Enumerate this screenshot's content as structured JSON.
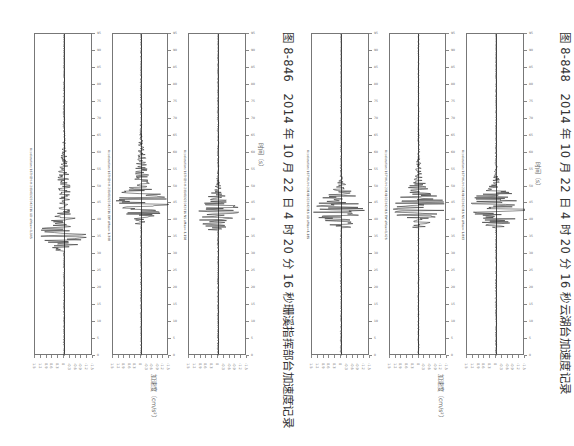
{
  "page": {
    "orientation": "rotated-90-clockwise"
  },
  "figures": [
    {
      "caption": "图 8-846　2014 年 10 月 22 日 4 时 20 分 16 秒珊溪指挥部台加速度记录",
      "time_axis_label": "时间（s）",
      "accel_axis_label": "加速度（cm/s²）",
      "traces": [
        {
          "title": "Acceleration: 16THZH-H-20141022042016 UD aMax=-1.145",
          "peak_pos": 0.62,
          "peak_amp": 0.85,
          "secondary_pos": 0.47,
          "decay": 0.9
        },
        {
          "title": "Acceleration: 16THZH-H-20141022042016 EW aMax=-1.308",
          "peak_pos": 0.53,
          "peak_amp": 0.95,
          "secondary_pos": 0.45,
          "decay": 1.0
        },
        {
          "title": "Acceleration: 16THZH-H-20141022042016 NS aMax=-1.158",
          "peak_pos": 0.55,
          "peak_amp": 0.7,
          "secondary_pos": 0.62,
          "decay": 0.8
        }
      ]
    },
    {
      "caption": "图 8-848　2014 年 10 月 22 日 4 时 20 分 16 秒云湖台加速度记录",
      "time_axis_label": "时间（s）",
      "accel_axis_label": "加速度（cm/s²）",
      "traces": [
        {
          "title": "Acceleration: 16TYHU-H-20141022042016 UD aMax=1.185",
          "peak_pos": 0.54,
          "peak_amp": 1.0,
          "secondary_pos": 0.58,
          "decay": 0.55
        },
        {
          "title": "Acceleration: 16TYHU-H-20141022042016 EW aMax=1.426",
          "peak_pos": 0.54,
          "peak_amp": 0.95,
          "secondary_pos": 0.5,
          "decay": 0.75
        },
        {
          "title": "Acceleration: 16TYHU-H-20141022042016 NS aMax=-1.893",
          "peak_pos": 0.54,
          "peak_amp": 1.05,
          "secondary_pos": 0.52,
          "decay": 0.5
        }
      ]
    }
  ],
  "time_ticks": [
    "0",
    "5",
    "10",
    "15",
    "20",
    "25",
    "30",
    "35",
    "40",
    "45",
    "50",
    "55",
    "60",
    "65",
    "70",
    "75",
    "80",
    "85",
    "90",
    "95"
  ],
  "accel_ticks": [
    "-1.5",
    "-1.2",
    "-0.9",
    "-0.6",
    "-0.3",
    "0",
    "0.3",
    "0.6",
    "0.9",
    "1.2",
    "1.5"
  ],
  "colors": {
    "trace": "#1a1a1a",
    "frame": "#777777",
    "text": "#333333"
  }
}
